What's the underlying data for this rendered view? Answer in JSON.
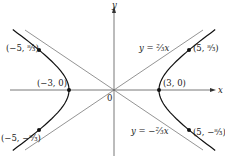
{
  "figure": {
    "type": "hyperbola",
    "equation_implied": "x^2/9 - y^2/4 = 1",
    "axes": {
      "x_label": "x",
      "y_label": "y",
      "origin_label": "0"
    },
    "asymptotes": [
      {
        "label": "y = ⅔x",
        "slope": 0.6667
      },
      {
        "label": "y = −⅔x",
        "slope": -0.6667
      }
    ],
    "vertices": [
      {
        "label": "(−3, 0)",
        "x": -3,
        "y": 0
      },
      {
        "label": "(3, 0)",
        "x": 3,
        "y": 0
      }
    ],
    "points": [
      {
        "label": "(−5, ⁸⁄₃)",
        "x": -5,
        "y": 2.667
      },
      {
        "label": "(5, ⁸⁄₃)",
        "x": 5,
        "y": 2.667
      },
      {
        "label": "(−5, −⁸⁄₃)",
        "x": -5,
        "y": -2.667
      },
      {
        "label": "(5, −⁸⁄₃)",
        "x": 5,
        "y": -2.667
      }
    ],
    "colors": {
      "curve": "#111111",
      "axis": "#555555",
      "asymptote": "#666666"
    }
  }
}
